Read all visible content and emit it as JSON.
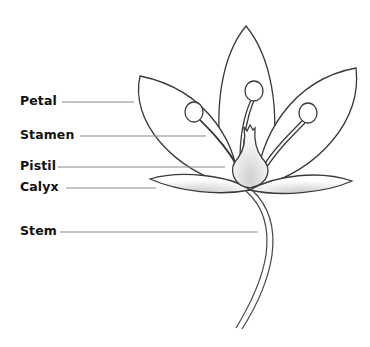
{
  "diagram": {
    "labels": [
      {
        "id": "petal",
        "text": "Petal",
        "x": 20,
        "y": 95,
        "line_x1": 62,
        "line_x2": 134,
        "line_y": 102
      },
      {
        "id": "stamen",
        "text": "Stamen",
        "x": 20,
        "y": 129,
        "line_x1": 80,
        "line_x2": 206,
        "line_y": 136
      },
      {
        "id": "pistil",
        "text": "Pistil",
        "x": 20,
        "y": 160,
        "line_x1": 58,
        "line_x2": 225,
        "line_y": 167
      },
      {
        "id": "calyx",
        "text": "Calyx",
        "x": 20,
        "y": 181,
        "line_x1": 66,
        "line_x2": 156,
        "line_y": 188
      },
      {
        "id": "stem",
        "text": "Stem",
        "x": 20,
        "y": 225,
        "line_x1": 60,
        "line_x2": 258,
        "line_y": 232
      }
    ],
    "colors": {
      "outline": "#3a3a3a",
      "leader_line": "#888888",
      "text": "#111111",
      "shade": "#d8d8d8"
    }
  }
}
